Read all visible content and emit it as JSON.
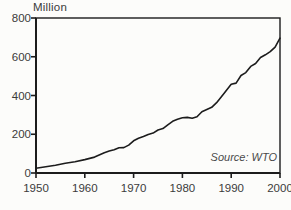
{
  "chart_data": {
    "type": "line",
    "ylabel": "Million",
    "xlabel": "",
    "source": "Source: WTO",
    "xlim": [
      1950,
      2000
    ],
    "ylim": [
      0,
      800
    ],
    "x_ticks": [
      1950,
      1960,
      1970,
      1980,
      1990,
      2000
    ],
    "y_ticks": [
      0,
      200,
      400,
      600,
      800
    ],
    "grid": false,
    "legend": "none",
    "line_color": "#1c1c1c",
    "axis_color": "#1c1c1c",
    "series": [
      {
        "name": "International tourist arrivals",
        "x": [
          1950,
          1952,
          1954,
          1956,
          1958,
          1960,
          1962,
          1964,
          1965,
          1966,
          1967,
          1968,
          1969,
          1970,
          1971,
          1972,
          1973,
          1974,
          1975,
          1976,
          1977,
          1978,
          1979,
          1980,
          1981,
          1982,
          1983,
          1984,
          1985,
          1986,
          1987,
          1988,
          1989,
          1990,
          1991,
          1992,
          1993,
          1994,
          1995,
          1996,
          1997,
          1998,
          1999,
          2000
        ],
        "y": [
          25,
          32,
          40,
          50,
          58,
          69,
          82,
          104,
          113,
          120,
          130,
          131,
          144,
          166,
          179,
          189,
          199,
          206,
          222,
          229,
          249,
          267,
          277,
          285,
          287,
          283,
          290,
          316,
          327,
          339,
          363,
          394,
          426,
          458,
          464,
          503,
          518,
          550,
          565,
          596,
          610,
          626,
          650,
          696
        ]
      }
    ]
  }
}
